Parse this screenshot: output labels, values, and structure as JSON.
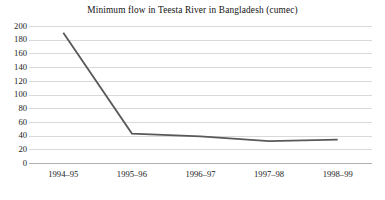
{
  "chart_data": {
    "type": "line",
    "title": "Minimum flow in Teesta River in Bangladesh (cumec)",
    "subtitle": "",
    "xlabel": "",
    "ylabel": "",
    "categories": [
      "1994–95",
      "1995–96",
      "1996–97",
      "1997–98",
      "1998–99"
    ],
    "series": [
      {
        "name": "Minimum flow (cumec)",
        "values": [
          190,
          43,
          39,
          32,
          34
        ]
      }
    ],
    "ylim": [
      0,
      200
    ],
    "yticks": [
      0,
      20,
      40,
      60,
      80,
      100,
      120,
      140,
      160,
      180,
      200
    ],
    "ytick_labels": [
      "0",
      "20",
      "40",
      "60",
      "80",
      "100",
      "120",
      "140",
      "160",
      "180",
      "200"
    ],
    "grid": "horizontal",
    "legend": "none",
    "markers": "none",
    "line_color": "#595959",
    "gridline_color": "#d9d9d9",
    "axis_color": "#b0b0b0",
    "background_color": "#ffffff",
    "annotations": []
  }
}
